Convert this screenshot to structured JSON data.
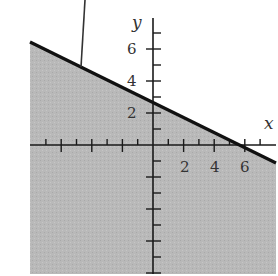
{
  "chart_data": {
    "type": "area",
    "title": "",
    "xlabel": "x",
    "ylabel": "y",
    "xlim": [
      -8,
      8
    ],
    "ylim": [
      -8,
      8.5
    ],
    "x_tick_labels": [
      "2",
      "4",
      "6"
    ],
    "y_tick_labels": [
      "2",
      "4",
      "6"
    ],
    "x_ticks_minor_step": 1,
    "y_ticks_minor_step": 1,
    "grid": false,
    "boundary_line": {
      "equation": "x + 2y = 5",
      "slope": -0.5,
      "y_intercept": 2.5,
      "x_intercept": 5,
      "style": "solid",
      "points": [
        [
          -8,
          6.5
        ],
        [
          8,
          -1.5
        ]
      ]
    },
    "shaded_region": {
      "inequality": "x + 2y <= 5",
      "side": "below",
      "color": "#b8b8b8"
    },
    "annotation_pointer": {
      "from": [
        -4.4,
        9.3
      ],
      "to": [
        -4.7,
        4.9
      ]
    }
  },
  "colors": {
    "shade": "#b7b7b7",
    "line": "#111111",
    "axis": "#1a1a1a",
    "background": "#ffffff"
  }
}
